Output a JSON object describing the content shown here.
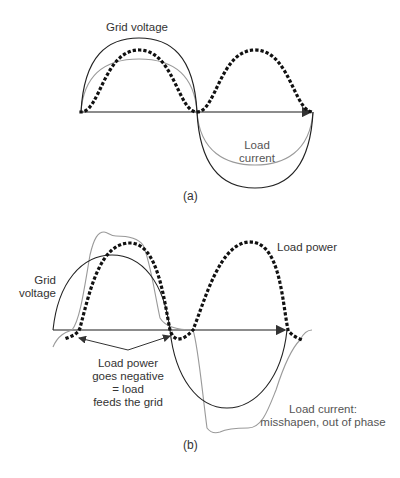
{
  "panel_a": {
    "caption": "(a)",
    "labels": {
      "grid_voltage": "Grid voltage",
      "load_current_line1": "Load",
      "load_current_line2": "current"
    }
  },
  "panel_b": {
    "caption": "(b)",
    "labels": {
      "load_power": "Load power",
      "grid_voltage_line1": "Grid",
      "grid_voltage_line2": "voltage",
      "negative_line1": "Load power",
      "negative_line2": "goes negative",
      "negative_line3": "= load",
      "negative_line4": "feeds the grid",
      "current_line1": "Load current:",
      "current_line2": "misshapen, out of phase"
    }
  },
  "colors": {
    "voltage": "#222222",
    "current": "#9a9a9a",
    "power": "#111111",
    "axis": "#555555"
  }
}
